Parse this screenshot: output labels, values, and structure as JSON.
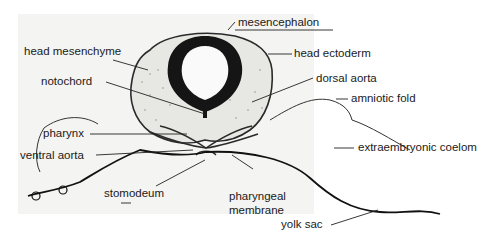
{
  "figure": {
    "labels": [
      {
        "id": "mesencephalon",
        "text": "mesencephalon"
      },
      {
        "id": "head_mesenchyme",
        "text": "head mesenchyme"
      },
      {
        "id": "head_ectoderm",
        "text": "head ectoderm"
      },
      {
        "id": "notochord",
        "text": "notochord"
      },
      {
        "id": "dorsal_aorta",
        "text": "dorsal aorta"
      },
      {
        "id": "amniotic_fold",
        "text": "amniotic fold"
      },
      {
        "id": "pharynx",
        "text": "pharynx"
      },
      {
        "id": "ventral_aorta",
        "text": "ventral aorta"
      },
      {
        "id": "extraembryonic_coelom",
        "text": "extraembryonic coelom"
      },
      {
        "id": "stomodeum",
        "text": "stomodeum"
      },
      {
        "id": "pharyngeal_membrane_1",
        "text": "pharyngeal"
      },
      {
        "id": "pharyngeal_membrane_2",
        "text": "membrane"
      },
      {
        "id": "yolk_sac",
        "text": "yolk sac"
      }
    ]
  }
}
